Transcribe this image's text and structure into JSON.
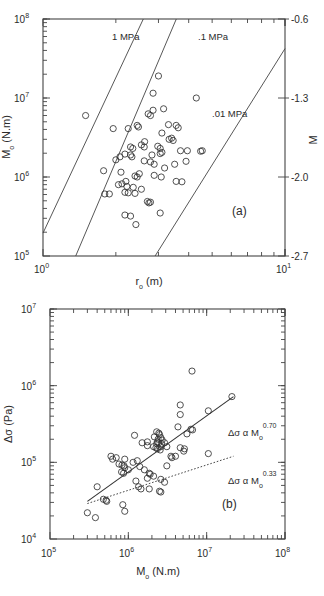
{
  "figure": {
    "title": "",
    "panels": [
      "a",
      "b"
    ]
  },
  "panel_a": {
    "id_label": "(a)",
    "xlabel": "r",
    "xlabel_sub": "o",
    "xlabel_unit": "(m)",
    "ylabel": "M",
    "ylabel_sub": "o",
    "ylabel_unit": "(N.m)",
    "y2label": "M",
    "xticks": [
      "10",
      "10"
    ],
    "xtick_exp": [
      "0",
      "1"
    ],
    "yticks": [
      "10",
      "10",
      "10",
      "10"
    ],
    "ytick_exp": [
      "5",
      "6",
      "7",
      "8"
    ],
    "y2ticks": [
      "-0.6",
      "-1.3",
      "-2.0",
      "-2.7"
    ],
    "stress_lines": [
      {
        "label": "1 MPa",
        "value": 1
      },
      {
        "label": ".1 MPa",
        "value": 0.1
      },
      {
        "label": ".01 MPa",
        "value": 0.01
      }
    ]
  },
  "panel_b": {
    "id_label": "(b)",
    "xlabel": "M",
    "xlabel_sub": "o",
    "xlabel_unit": "(N.m)",
    "ylabel": "Δσ",
    "ylabel_unit": "(Pa)",
    "xticks": [
      "10",
      "10",
      "10",
      "10"
    ],
    "xtick_exp": [
      "5",
      "6",
      "7",
      "8"
    ],
    "yticks": [
      "10",
      "10",
      "10",
      "10"
    ],
    "ytick_exp": [
      "4",
      "5",
      "6",
      "7"
    ],
    "annotations": [
      {
        "text": "Δσ  α  M",
        "sub": "o",
        "exp": "0.70",
        "style": "solid"
      },
      {
        "text": "Δσ  α  M",
        "sub": "o",
        "exp": "0.33",
        "style": "dotted"
      }
    ]
  },
  "chart_data": [
    {
      "type": "scatter",
      "panel": "a",
      "title": "",
      "xlabel": "r_o (m)",
      "ylabel": "M_o (N.m)",
      "y2label": "M",
      "xscale": "log",
      "yscale": "log",
      "xlim": [
        1,
        10
      ],
      "ylim": [
        100000,
        100000000
      ],
      "y2lim": [
        -2.7,
        -0.6
      ],
      "y2ticks": [
        -0.6,
        -1.3,
        -2.0,
        -2.7
      ],
      "grid": false,
      "legend": "none",
      "marker": "open-circle",
      "lines": [
        {
          "name": "1 MPa",
          "slope": 3,
          "x": [
            1.0,
            3.7
          ],
          "y": [
            200000,
            100000000
          ]
        },
        {
          "name": ".1 MPa",
          "slope": 3,
          "x": [
            1.35,
            8.0
          ],
          "y": [
            100000,
            100000000
          ]
        },
        {
          "name": ".01 MPa",
          "slope": 3,
          "x": [
            2.9,
            10.0
          ],
          "y": [
            100000,
            23000000
          ]
        }
      ],
      "points": [
        [
          1.5,
          6000000
        ],
        [
          1.95,
          4100000
        ],
        [
          2.25,
          4100000
        ],
        [
          2.45,
          4500000
        ],
        [
          2.48,
          4300000
        ],
        [
          3.0,
          19000000
        ],
        [
          2.85,
          11500000
        ],
        [
          4.3,
          10000000
        ],
        [
          2.85,
          7000000
        ],
        [
          3.15,
          7300000
        ],
        [
          2.72,
          6300000
        ],
        [
          2.78,
          6000000
        ],
        [
          3.3,
          4600000
        ],
        [
          3.55,
          4500000
        ],
        [
          3.1,
          3600000
        ],
        [
          3.4,
          3100000
        ],
        [
          3.45,
          2900000
        ],
        [
          3.32,
          3000000
        ],
        [
          2.63,
          2800000
        ],
        [
          2.55,
          2550000
        ],
        [
          2.62,
          2400000
        ],
        [
          2.3,
          2400000
        ],
        [
          2.35,
          2300000
        ],
        [
          2.98,
          2450000
        ],
        [
          3.05,
          2300000
        ],
        [
          3.7,
          2150000
        ],
        [
          3.95,
          2150000
        ],
        [
          3.1,
          2050000
        ],
        [
          2.18,
          1950000
        ],
        [
          2.3,
          1900000
        ],
        [
          2.33,
          1800000
        ],
        [
          2.08,
          1800000
        ],
        [
          2.0,
          1650000
        ],
        [
          2.62,
          1600000
        ],
        [
          2.78,
          1550000
        ],
        [
          3.5,
          1450000
        ],
        [
          2.88,
          1450000
        ],
        [
          3.18,
          1300000
        ],
        [
          1.78,
          1200000
        ],
        [
          2.1,
          1150000
        ],
        [
          2.5,
          1100000
        ],
        [
          2.88,
          1050000
        ],
        [
          3.08,
          1000000
        ],
        [
          2.4,
          1030000
        ],
        [
          2.45,
          1000000
        ],
        [
          3.55,
          880000
        ],
        [
          3.75,
          870000
        ],
        [
          2.2,
          880000
        ],
        [
          2.12,
          820000
        ],
        [
          2.05,
          800000
        ],
        [
          2.22,
          760000
        ],
        [
          2.36,
          740000
        ],
        [
          2.55,
          700000
        ],
        [
          1.8,
          610000
        ],
        [
          1.88,
          610000
        ],
        [
          2.18,
          640000
        ],
        [
          2.25,
          630000
        ],
        [
          2.4,
          620000
        ],
        [
          2.7,
          490000
        ],
        [
          2.78,
          480000
        ],
        [
          2.74,
          470000
        ],
        [
          3.05,
          350000
        ],
        [
          2.18,
          330000
        ],
        [
          2.3,
          320000
        ],
        [
          2.42,
          250000
        ],
        [
          3.05,
          1980000
        ],
        [
          2.82,
          1900000
        ],
        [
          4.55,
          2150000
        ],
        [
          4.48,
          2120000
        ],
        [
          3.9,
          1580000
        ],
        [
          3.62,
          4200000
        ]
      ],
      "n_points": 71
    },
    {
      "type": "scatter",
      "panel": "b",
      "title": "",
      "xlabel": "M_o (N.m)",
      "ylabel": "Δσ (Pa)",
      "xscale": "log",
      "yscale": "log",
      "xlim": [
        100000,
        100000000
      ],
      "ylim": [
        10000,
        10000000
      ],
      "grid": false,
      "legend": "none",
      "marker": "open-circle",
      "fits": [
        {
          "name": "Δσ α M_o^0.70",
          "exponent": 0.7,
          "style": "solid",
          "x": [
            300000,
            22000000
          ],
          "y": [
            31000,
            720000
          ]
        },
        {
          "name": "Δσ α M_o^0.33",
          "exponent": 0.33,
          "style": "dotted",
          "x": [
            300000,
            22000000
          ],
          "y": [
            29000,
            120000
          ]
        }
      ],
      "points": [
        [
          6500000,
          1550000
        ],
        [
          21000000,
          720000
        ],
        [
          10500000,
          470000
        ],
        [
          4600000,
          560000
        ],
        [
          4600000,
          420000
        ],
        [
          6300000,
          270000
        ],
        [
          6600000,
          265000
        ],
        [
          4300000,
          290000
        ],
        [
          5600000,
          235000
        ],
        [
          2300000,
          250000
        ],
        [
          2450000,
          240000
        ],
        [
          2500000,
          230000
        ],
        [
          1200000,
          225000
        ],
        [
          2150000,
          215000
        ],
        [
          2600000,
          210000
        ],
        [
          2400000,
          200000
        ],
        [
          2700000,
          195000
        ],
        [
          2350000,
          185000
        ],
        [
          2450000,
          180000
        ],
        [
          2300000,
          175000
        ],
        [
          2650000,
          175000
        ],
        [
          2900000,
          180000
        ],
        [
          1750000,
          185000
        ],
        [
          1500000,
          180000
        ],
        [
          1750000,
          165000
        ],
        [
          2100000,
          160000
        ],
        [
          2600000,
          160000
        ],
        [
          3100000,
          160000
        ],
        [
          4600000,
          155000
        ],
        [
          5200000,
          150000
        ],
        [
          5100000,
          140000
        ],
        [
          10500000,
          130000
        ],
        [
          600000,
          120000
        ],
        [
          700000,
          115000
        ],
        [
          630000,
          110000
        ],
        [
          900000,
          110000
        ],
        [
          1300000,
          105000
        ],
        [
          1150000,
          100000
        ],
        [
          3500000,
          120000
        ],
        [
          3600000,
          115000
        ],
        [
          4000000,
          120000
        ],
        [
          760000,
          95000
        ],
        [
          830000,
          92000
        ],
        [
          880000,
          90000
        ],
        [
          900000,
          85000
        ],
        [
          1000000,
          80000
        ],
        [
          820000,
          75000
        ],
        [
          870000,
          72000
        ],
        [
          1400000,
          88000
        ],
        [
          1600000,
          80000
        ],
        [
          3100000,
          90000
        ],
        [
          1850000,
          72000
        ],
        [
          1900000,
          70000
        ],
        [
          2100000,
          66000
        ],
        [
          1750000,
          62000
        ],
        [
          1250000,
          57000
        ],
        [
          2600000,
          60000
        ],
        [
          2900000,
          55000
        ],
        [
          1350000,
          48000
        ],
        [
          1450000,
          45000
        ],
        [
          1850000,
          45000
        ],
        [
          2500000,
          42000
        ],
        [
          2600000,
          41000
        ],
        [
          400000,
          48000
        ],
        [
          480000,
          33000
        ],
        [
          520000,
          32000
        ],
        [
          530000,
          31000
        ],
        [
          300000,
          22000
        ],
        [
          380000,
          19000
        ],
        [
          850000,
          28000
        ],
        [
          900000,
          23000
        ],
        [
          2250000,
          155000
        ],
        [
          2350000,
          150000
        ],
        [
          2550000,
          145000
        ]
      ],
      "n_points": 74
    }
  ]
}
